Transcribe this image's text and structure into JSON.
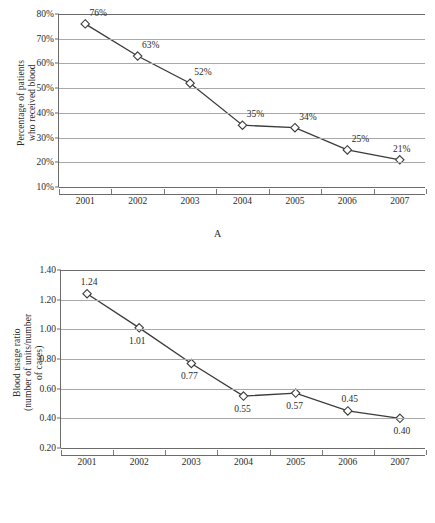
{
  "figure": {
    "panels": [
      {
        "caption": "A",
        "ylabel_lines": [
          "Percentage of patients",
          "who received blood"
        ],
        "xlabel": ""
      },
      {
        "caption": "B",
        "ylabel_lines": [
          "Blood usage ratio",
          "(number of units/number",
          "of cases)"
        ],
        "xlabel": ""
      }
    ]
  },
  "chart_data": [
    {
      "type": "line",
      "panel": "A",
      "title": "",
      "xlabel": "",
      "ylabel": "Percentage of patients who received blood",
      "x": [
        "2001",
        "2002",
        "2003",
        "2004",
        "2005",
        "2006",
        "2007"
      ],
      "categories": [
        "2001",
        "2002",
        "2003",
        "2004",
        "2005",
        "2006",
        "2007"
      ],
      "values": [
        76,
        63,
        52,
        35,
        34,
        25,
        21
      ],
      "point_labels": [
        "76%",
        "63%",
        "52%",
        "35%",
        "34%",
        "25%",
        "21%"
      ],
      "label_positions": [
        "above",
        "above",
        "above",
        "above",
        "above",
        "above",
        "above"
      ],
      "ylim": [
        10,
        80
      ],
      "ytick_labels": [
        "10%",
        "20%",
        "30%",
        "40%",
        "50%",
        "60%",
        "70%",
        "80%"
      ],
      "ytick_values": [
        10,
        20,
        30,
        40,
        50,
        60,
        70,
        80
      ],
      "grid": true,
      "legend": "none",
      "marker": "open-diamond",
      "line_color": "#3a3a3a",
      "grid_color": "#a8a8a8"
    },
    {
      "type": "line",
      "panel": "B",
      "title": "",
      "xlabel": "",
      "ylabel": "Blood usage ratio (number of units/number of cases)",
      "x": [
        "2001",
        "2002",
        "2003",
        "2004",
        "2005",
        "2006",
        "2007"
      ],
      "categories": [
        "2001",
        "2002",
        "2003",
        "2004",
        "2005",
        "2006",
        "2007"
      ],
      "values": [
        1.24,
        1.01,
        0.77,
        0.55,
        0.57,
        0.45,
        0.4
      ],
      "point_labels": [
        "1.24",
        "1.01",
        "0.77",
        "0.55",
        "0.57",
        "0.45",
        "0.40"
      ],
      "label_positions": [
        "above",
        "below",
        "below",
        "below",
        "below",
        "above",
        "below"
      ],
      "ylim": [
        0.2,
        1.4
      ],
      "ytick_labels": [
        "0.20",
        "0.40",
        "0.60",
        "0.80",
        "1.00",
        "1.20",
        "1.40"
      ],
      "ytick_values": [
        0.2,
        0.4,
        0.6,
        0.8,
        1.0,
        1.2,
        1.4
      ],
      "grid": true,
      "legend": "none",
      "marker": "open-diamond",
      "line_color": "#3a3a3a",
      "grid_color": "#a8a8a8"
    }
  ]
}
